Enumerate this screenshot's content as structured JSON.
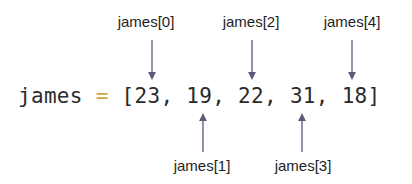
{
  "diagram": {
    "code": {
      "variable": "james",
      "operator": "=",
      "open_bracket": "[",
      "close_bracket": "]",
      "separator": ", ",
      "values": [
        "23",
        "19",
        "22",
        "31",
        "18"
      ]
    },
    "labels_top": [
      {
        "text": "james[0]",
        "index": 0
      },
      {
        "text": "james[2]",
        "index": 2
      },
      {
        "text": "james[4]",
        "index": 4
      }
    ],
    "labels_bottom": [
      {
        "text": "james[1]",
        "index": 1
      },
      {
        "text": "james[3]",
        "index": 3
      }
    ],
    "colors": {
      "text": "#1e1e1e",
      "code_text": "#2b2b2b",
      "operator": "#c9a64a",
      "arrow": "#5a5a78",
      "background": "#ffffff"
    }
  }
}
